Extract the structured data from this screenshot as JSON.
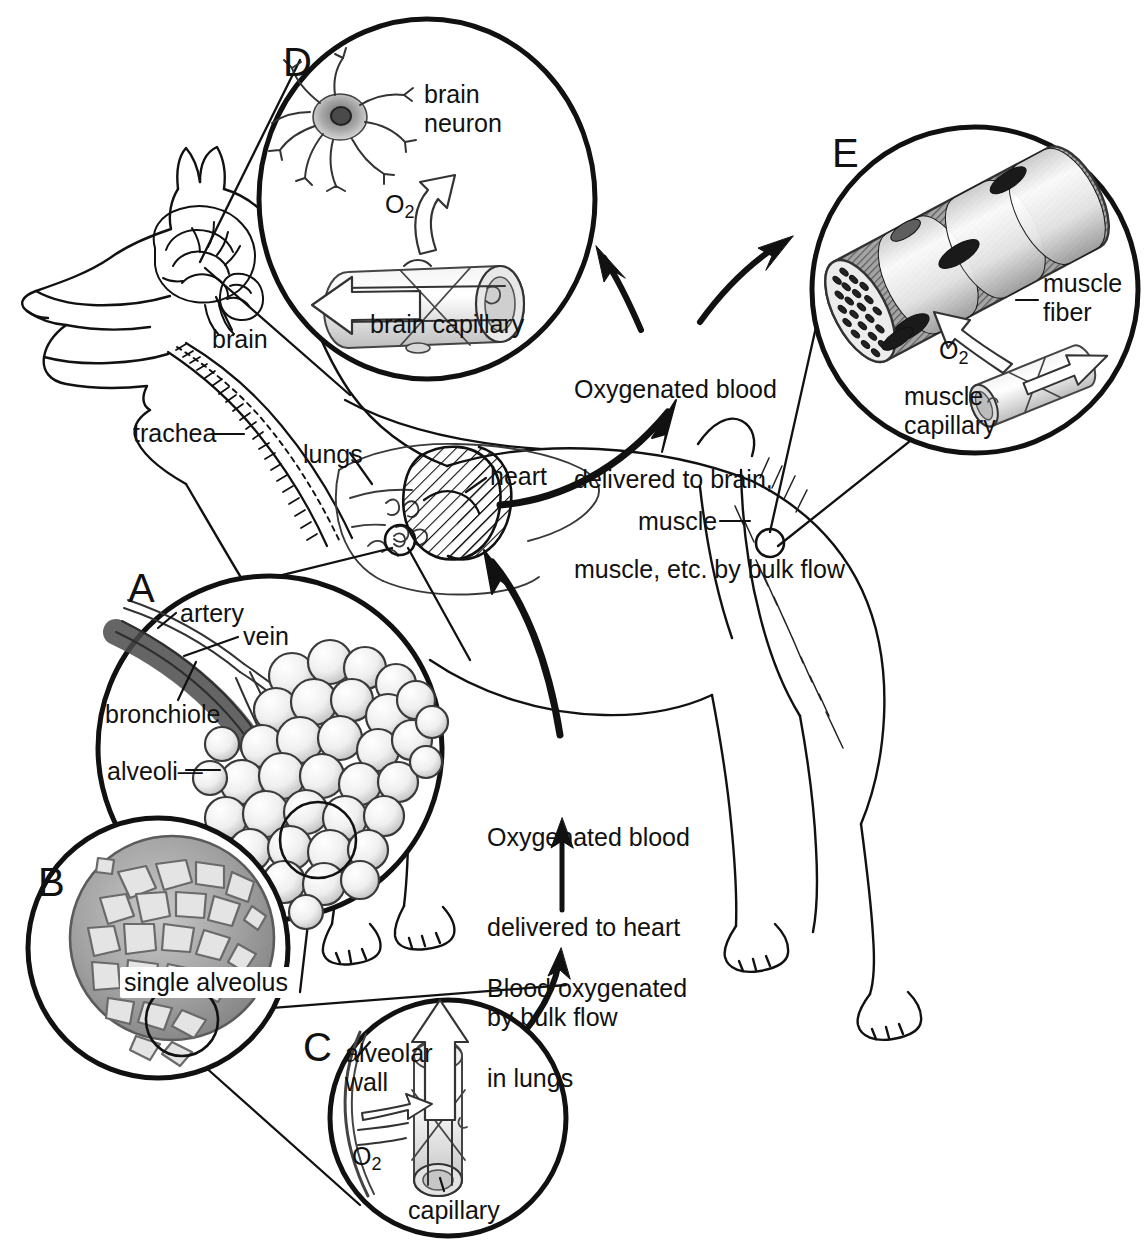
{
  "figure": {
    "domain": "Diagram",
    "background_color": "#ffffff",
    "ink_color": "#111111"
  },
  "panels": [
    {
      "id": "A",
      "letter": "A",
      "topic": "lung alveoli cluster"
    },
    {
      "id": "B",
      "letter": "B",
      "topic": "single alveolus capillary network"
    },
    {
      "id": "C",
      "letter": "C",
      "topic": "alveolar wall gas exchange"
    },
    {
      "id": "D",
      "letter": "D",
      "topic": "brain neuron and capillary"
    },
    {
      "id": "E",
      "letter": "E",
      "topic": "muscle fiber and capillary"
    }
  ],
  "labels": {
    "brain": "brain",
    "trachea": "trachea",
    "lungs": "lungs",
    "heart": "heart",
    "muscle": "muscle",
    "brain_neuron": "brain\nneuron",
    "brain_neuron_line1": "brain",
    "brain_neuron_line2": "neuron",
    "brain_capillary": "brain capillary",
    "muscle_fiber_line1": "muscle",
    "muscle_fiber_line2": "fiber",
    "muscle_capillary_line1": "muscle",
    "muscle_capillary_line2": "capillary",
    "artery": "artery",
    "vein": "vein",
    "bronchiole": "bronchiole",
    "alveoli": "alveoli—",
    "alveoli_plain": "alveoli",
    "single_alveolus": "single alveolus",
    "alveolar_wall_line1": "alveolar",
    "alveolar_wall_line2": "wall",
    "capillary": "capillary",
    "oxygen_d": "O",
    "oxygen_c": "O",
    "oxygen_e": "O",
    "oxygen_subscript": "2"
  },
  "flow_text": {
    "to_brain_muscle": {
      "line1": "Oxygenated blood",
      "line2": "delivered to brain,",
      "line3": "muscle, etc. by bulk flow"
    },
    "to_heart": {
      "line1": "Oxygenated blood",
      "line2": "delivered to heart",
      "line3": "by bulk flow"
    },
    "in_lungs": {
      "line1": "Blood oxygenated",
      "line2": "in lungs"
    }
  },
  "colors": {
    "ink": "#111111",
    "paper": "#ffffff",
    "tissue_mid": "#9a9a9a",
    "tissue_dark": "#6e6e6e",
    "tissue_light": "#d4d4d4",
    "muscle_band_dark": "#8c8c8c",
    "muscle_band_light": "#ededed",
    "alveolus_fill": "#a8a8a8"
  }
}
